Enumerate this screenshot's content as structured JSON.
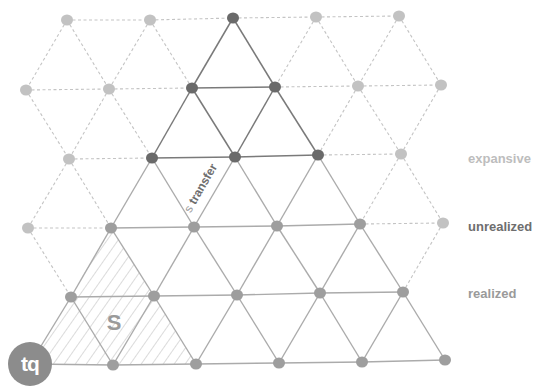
{
  "diagram": {
    "title": "",
    "nodes": [
      {
        "id": "r0c0",
        "x": 67,
        "y": 20,
        "state": "expansive"
      },
      {
        "id": "r0c1",
        "x": 150,
        "y": 20,
        "state": "expansive"
      },
      {
        "id": "r0c2",
        "x": 233,
        "y": 18,
        "state": "unrealized"
      },
      {
        "id": "r0c3",
        "x": 316,
        "y": 17,
        "state": "expansive"
      },
      {
        "id": "r0c4",
        "x": 399,
        "y": 16,
        "state": "expansive"
      },
      {
        "id": "r1c0",
        "x": 26,
        "y": 90,
        "state": "expansive"
      },
      {
        "id": "r1c1",
        "x": 109,
        "y": 89,
        "state": "expansive"
      },
      {
        "id": "r1c2",
        "x": 192,
        "y": 88,
        "state": "unrealized"
      },
      {
        "id": "r1c3",
        "x": 275,
        "y": 87,
        "state": "unrealized"
      },
      {
        "id": "r1c4",
        "x": 358,
        "y": 86,
        "state": "expansive"
      },
      {
        "id": "r1c5",
        "x": 441,
        "y": 85,
        "state": "expansive"
      },
      {
        "id": "r2c0",
        "x": 69,
        "y": 159,
        "state": "expansive"
      },
      {
        "id": "r2c1",
        "x": 152,
        "y": 158,
        "state": "unrealized"
      },
      {
        "id": "r2c2",
        "x": 235,
        "y": 157,
        "state": "unrealized"
      },
      {
        "id": "r2c3",
        "x": 318,
        "y": 155,
        "state": "unrealized"
      },
      {
        "id": "r2c4",
        "x": 401,
        "y": 154,
        "state": "expansive"
      },
      {
        "id": "r3c0",
        "x": 28,
        "y": 228,
        "state": "expansive"
      },
      {
        "id": "r3c1",
        "x": 111,
        "y": 228,
        "state": "realized"
      },
      {
        "id": "r3c2",
        "x": 194,
        "y": 227,
        "state": "realized"
      },
      {
        "id": "r3c3",
        "x": 277,
        "y": 226,
        "state": "realized"
      },
      {
        "id": "r3c4",
        "x": 360,
        "y": 224,
        "state": "realized"
      },
      {
        "id": "r3c5",
        "x": 443,
        "y": 223,
        "state": "expansive"
      },
      {
        "id": "r4c0",
        "x": 71,
        "y": 297,
        "state": "realized"
      },
      {
        "id": "r4c1",
        "x": 154,
        "y": 296,
        "state": "realized"
      },
      {
        "id": "r4c2",
        "x": 237,
        "y": 295,
        "state": "realized"
      },
      {
        "id": "r4c3",
        "x": 320,
        "y": 293,
        "state": "realized"
      },
      {
        "id": "r4c4",
        "x": 403,
        "y": 292,
        "state": "realized"
      },
      {
        "id": "r5c1",
        "x": 113,
        "y": 365,
        "state": "realized"
      },
      {
        "id": "r5c2",
        "x": 196,
        "y": 364,
        "state": "realized"
      },
      {
        "id": "r5c3",
        "x": 279,
        "y": 363,
        "state": "realized"
      },
      {
        "id": "r5c4",
        "x": 362,
        "y": 362,
        "state": "realized"
      },
      {
        "id": "r5c5",
        "x": 445,
        "y": 360,
        "state": "realized"
      }
    ],
    "tq_anchor": {
      "x": 30,
      "y": 364
    },
    "dashed_edges": [
      [
        "r0c0",
        "r0c1"
      ],
      [
        "r0c1",
        "r0c2"
      ],
      [
        "r0c2",
        "r0c3"
      ],
      [
        "r0c3",
        "r0c4"
      ],
      [
        "r0c0",
        "r1c0"
      ],
      [
        "r0c0",
        "r1c1"
      ],
      [
        "r0c1",
        "r1c1"
      ],
      [
        "r0c1",
        "r1c2"
      ],
      [
        "r0c3",
        "r1c3"
      ],
      [
        "r0c3",
        "r1c4"
      ],
      [
        "r0c4",
        "r1c4"
      ],
      [
        "r0c4",
        "r1c5"
      ],
      [
        "r1c0",
        "r1c1"
      ],
      [
        "r1c1",
        "r1c2"
      ],
      [
        "r1c3",
        "r1c4"
      ],
      [
        "r1c4",
        "r1c5"
      ],
      [
        "r1c0",
        "r2c0"
      ],
      [
        "r1c1",
        "r2c0"
      ],
      [
        "r1c1",
        "r2c1"
      ],
      [
        "r1c4",
        "r2c3"
      ],
      [
        "r1c4",
        "r2c4"
      ],
      [
        "r1c5",
        "r2c4"
      ],
      [
        "r2c0",
        "r2c1"
      ],
      [
        "r2c3",
        "r2c4"
      ],
      [
        "r2c0",
        "r3c0"
      ],
      [
        "r2c0",
        "r3c1"
      ],
      [
        "r2c4",
        "r3c4"
      ],
      [
        "r2c4",
        "r3c5"
      ],
      [
        "r3c0",
        "r3c1"
      ],
      [
        "r3c4",
        "r3c5"
      ],
      [
        "r3c0",
        "r4c0"
      ],
      [
        "r3c5",
        "r4c4"
      ]
    ],
    "dark_edges": [
      [
        "r0c2",
        "r1c2"
      ],
      [
        "r0c2",
        "r1c3"
      ],
      [
        "r1c2",
        "r1c3"
      ],
      [
        "r1c2",
        "r2c1"
      ],
      [
        "r1c2",
        "r2c2"
      ],
      [
        "r1c3",
        "r2c2"
      ],
      [
        "r1c3",
        "r2c3"
      ],
      [
        "r2c1",
        "r2c2"
      ],
      [
        "r2c2",
        "r2c3"
      ]
    ],
    "solid_edges": [
      [
        "r2c1",
        "r3c1"
      ],
      [
        "r2c1",
        "r3c2"
      ],
      [
        "r2c2",
        "r3c2"
      ],
      [
        "r2c2",
        "r3c3"
      ],
      [
        "r2c3",
        "r3c3"
      ],
      [
        "r2c3",
        "r3c4"
      ],
      [
        "r3c1",
        "r3c2"
      ],
      [
        "r3c2",
        "r3c3"
      ],
      [
        "r3c3",
        "r3c4"
      ],
      [
        "r3c1",
        "r4c0"
      ],
      [
        "r3c1",
        "r4c1"
      ],
      [
        "r3c2",
        "r4c1"
      ],
      [
        "r3c2",
        "r4c2"
      ],
      [
        "r3c3",
        "r4c2"
      ],
      [
        "r3c3",
        "r4c3"
      ],
      [
        "r3c4",
        "r4c3"
      ],
      [
        "r3c4",
        "r4c4"
      ],
      [
        "r4c0",
        "r4c1"
      ],
      [
        "r4c1",
        "r4c2"
      ],
      [
        "r4c2",
        "r4c3"
      ],
      [
        "r4c3",
        "r4c4"
      ],
      [
        "r4c0",
        "tq"
      ],
      [
        "r4c0",
        "r5c1"
      ],
      [
        "r4c1",
        "r5c1"
      ],
      [
        "r4c1",
        "r5c2"
      ],
      [
        "r4c2",
        "r5c2"
      ],
      [
        "r4c2",
        "r5c3"
      ],
      [
        "r4c3",
        "r5c3"
      ],
      [
        "r4c3",
        "r5c4"
      ],
      [
        "r4c4",
        "r5c4"
      ],
      [
        "r4c4",
        "r5c5"
      ],
      [
        "tq",
        "r5c1"
      ],
      [
        "r5c1",
        "r5c2"
      ],
      [
        "r5c2",
        "r5c3"
      ],
      [
        "r5c3",
        "r5c4"
      ],
      [
        "r5c4",
        "r5c5"
      ]
    ],
    "hatched_region": [
      [
        30,
        364
      ],
      [
        111,
        228
      ],
      [
        196,
        364
      ]
    ],
    "region_label": {
      "text": "S",
      "x": 114,
      "y": 330
    },
    "transfer_label": {
      "text": "s transfer",
      "x": 204,
      "y": 190,
      "angle": -60
    },
    "tq_badge": "tq"
  },
  "legend": {
    "expansive": {
      "text": "expansive",
      "x": 468,
      "y": 160,
      "color": "#bdbdbd"
    },
    "unrealized": {
      "text": "unrealized",
      "x": 468,
      "y": 228,
      "color": "#6e6e6e"
    },
    "realized": {
      "text": "realized",
      "x": 468,
      "y": 295,
      "color": "#9a9a9a"
    }
  },
  "colors": {
    "expansive_node": "#c2c2c2",
    "unrealized_node": "#6a6a6a",
    "realized_node": "#9e9e9e",
    "dashed_edge": "#c4c4c4",
    "dark_edge": "#7a7a7a",
    "solid_edge": "#ababab",
    "hatch": "#b8b8b8"
  }
}
